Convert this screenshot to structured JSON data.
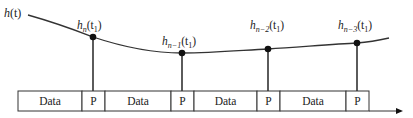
{
  "curve": {
    "label": "h(t)",
    "label_main": "h",
    "label_arg": "(t)"
  },
  "samples": [
    {
      "base": "h",
      "sub": "n",
      "arg": "(t",
      "arg_sub": "1",
      "close": ")"
    },
    {
      "base": "h",
      "sub": "n−1",
      "arg": "(t",
      "arg_sub": "1",
      "close": ")"
    },
    {
      "base": "h",
      "sub": "n−2",
      "arg": "(t",
      "arg_sub": "1",
      "close": ")"
    },
    {
      "base": "h",
      "sub": "n−3",
      "arg": "(t",
      "arg_sub": "1",
      "close": ")"
    }
  ],
  "frame": {
    "segments": [
      {
        "type": "data",
        "label": "Data"
      },
      {
        "type": "pilot",
        "label": "P"
      },
      {
        "type": "data",
        "label": "Data"
      },
      {
        "type": "pilot",
        "label": "P"
      },
      {
        "type": "data",
        "label": "Data"
      },
      {
        "type": "pilot",
        "label": "P"
      },
      {
        "type": "data",
        "label": "Data"
      },
      {
        "type": "pilot",
        "label": "P"
      }
    ]
  },
  "axis": {
    "direction": "time-right-arrow"
  }
}
